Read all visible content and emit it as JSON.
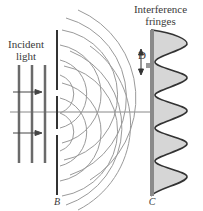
{
  "figure": {
    "labels": {
      "incident_line1": "Incident",
      "incident_line2": "light",
      "fringes_line1": "Interference",
      "fringes_line2": "fringes",
      "barrier": "B",
      "screen": "C",
      "spacing": "D"
    },
    "colors": {
      "line": "#444444",
      "wavefront": "#9a9a9a",
      "fringe_fill": "#d6d6d6",
      "screen": "#8a8a8a"
    },
    "elements": {
      "incident_wavefronts": 3,
      "incident_arrows": 2,
      "slits": 2,
      "fringe_peaks": 6
    }
  }
}
